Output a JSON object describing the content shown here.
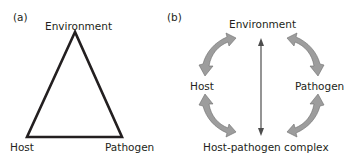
{
  "panel_a": {
    "label": "(a)",
    "top": "Environment",
    "bottom_left": "Host",
    "bottom_right": "Pathogen"
  },
  "panel_b": {
    "label": "(b)",
    "top": "Environment",
    "left": "Host",
    "right": "Pathogen",
    "bottom": "Host-pathogen complex"
  },
  "colors": {
    "line": "#231f20",
    "arrow_fill": "#9d9d9d",
    "arrow_stroke": "#6d6d6d"
  }
}
